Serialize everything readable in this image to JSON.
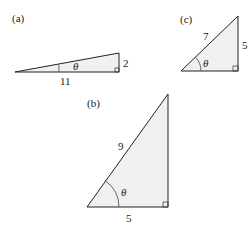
{
  "figures": [
    {
      "id": "a",
      "label": "(a)",
      "sides": {
        "hypotenuse": "",
        "adjacent": "11",
        "opposite": "2"
      },
      "angle": "θ"
    },
    {
      "id": "b",
      "label": "(b)",
      "sides": {
        "hypotenuse": "9",
        "adjacent": "5",
        "opposite": ""
      },
      "angle": "θ"
    },
    {
      "id": "c",
      "label": "(c)",
      "sides": {
        "hypotenuse": "7",
        "adjacent": "",
        "opposite": "5"
      },
      "angle": "θ"
    }
  ]
}
